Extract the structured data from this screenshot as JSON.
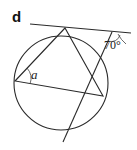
{
  "figure": {
    "part_label": "d",
    "angles": {
      "unknown": {
        "label": "a"
      },
      "given": {
        "value_label": "70°",
        "degrees": 70
      }
    },
    "elements": {
      "circle": "circle",
      "triangle": "inscribed-triangle",
      "tangent": "tangent-line",
      "secant": "secant-line"
    },
    "colors": {
      "line": "#2a2a2a",
      "background": "#ffffff"
    }
  }
}
